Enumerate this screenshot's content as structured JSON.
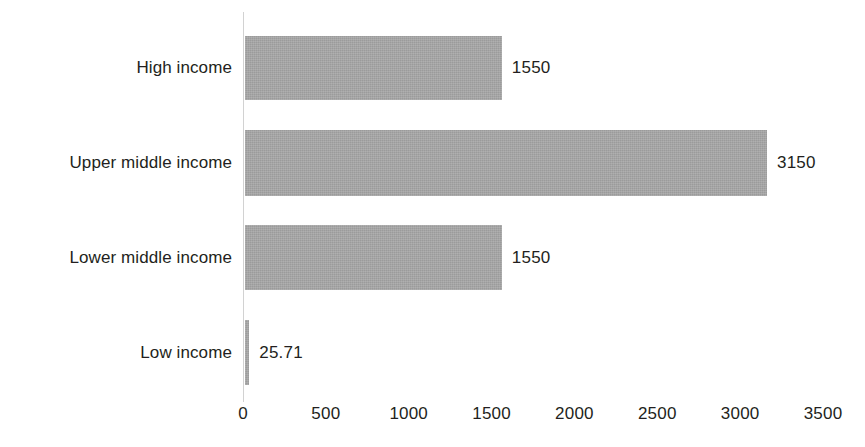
{
  "chart_data": {
    "type": "bar",
    "orientation": "horizontal",
    "title": "",
    "subtitle": "",
    "xlabel": "",
    "ylabel": "",
    "categories": [
      "High income",
      "Upper middle income",
      "Lower middle income",
      "Low income"
    ],
    "values": [
      1550,
      3150,
      1550,
      25.71
    ],
    "value_labels": [
      "1550",
      "3150",
      "1550",
      "25.71"
    ],
    "xlim": [
      0,
      3500
    ],
    "xticks": [
      0,
      500,
      1000,
      1500,
      2000,
      2500,
      3000,
      3500
    ],
    "xtick_labels": [
      "0",
      "500",
      "1000",
      "1500",
      "2000",
      "2500",
      "3000",
      "3500"
    ],
    "grid": false,
    "legend": null,
    "legend_position": "none",
    "bar_color": "#a9a9a9",
    "text_color": "#231f20",
    "axis_color": "#d2d2d2",
    "background_color": "#ffffff"
  },
  "axis": {
    "tick_0": "0",
    "tick_1": "500",
    "tick_2": "1000",
    "tick_3": "1500",
    "tick_4": "2000",
    "tick_5": "2500",
    "tick_6": "3000",
    "tick_7": "3500"
  },
  "series": {
    "bar_0": {
      "label": "High income",
      "value": "1550"
    },
    "bar_1": {
      "label": "Upper middle income",
      "value": "3150"
    },
    "bar_2": {
      "label": "Lower middle income",
      "value": "1550"
    },
    "bar_3": {
      "label": "Low income",
      "value": "25.71"
    }
  }
}
